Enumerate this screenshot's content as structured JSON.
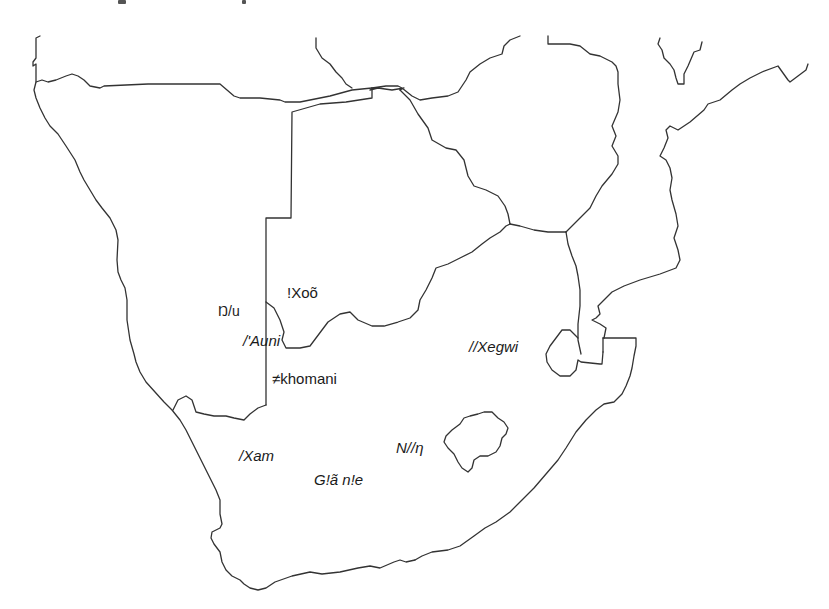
{
  "map": {
    "title": "",
    "region": "Southern Africa",
    "line_color": "#333333",
    "background": "#ffffff",
    "labels": [
      {
        "id": "xoo",
        "text": "!Xoõ",
        "x": 287,
        "y": 285,
        "italic": false
      },
      {
        "id": "nu",
        "text": "Ŋ/u",
        "x": 218,
        "y": 304,
        "italic": false
      },
      {
        "id": "auni",
        "text": "/'Auni",
        "x": 243,
        "y": 333,
        "italic": true
      },
      {
        "id": "khomani",
        "text": "≠khomani",
        "x": 272,
        "y": 371,
        "italic": false
      },
      {
        "id": "xegwi",
        "text": "//Xegwi",
        "x": 469,
        "y": 339,
        "italic": true
      },
      {
        "id": "xam",
        "text": "/Xam",
        "x": 239,
        "y": 448,
        "italic": true
      },
      {
        "id": "nng",
        "text": "N//η",
        "x": 396,
        "y": 440,
        "italic": true
      },
      {
        "id": "giane",
        "text": "G!ã n!e",
        "x": 314,
        "y": 472,
        "italic": true
      }
    ]
  }
}
